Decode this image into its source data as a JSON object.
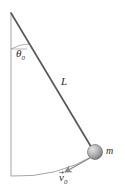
{
  "figure": {
    "kind": "pendulum-diagram",
    "background_color": "#ffffff",
    "line_color": "#4a4a4a",
    "thin_line_color": "#9a9a9a",
    "text_color": "#2b2b2b",
    "bob_color_light": "#d8d8d8",
    "bob_color_mid": "#a9a9a9",
    "bob_color_dark": "#7d7d7d"
  },
  "labels": {
    "angle": {
      "symbol": "θ",
      "subscript": "0",
      "text": "θ0"
    },
    "length": {
      "symbol": "L",
      "text": "L"
    },
    "mass": {
      "symbol": "m",
      "text": "m"
    },
    "velocity": {
      "symbol": "v",
      "subscript": "0",
      "text": "v0"
    }
  },
  "geometry": {
    "pivot": {
      "x": 11,
      "y": 13
    },
    "bob_center": {
      "x": 95,
      "y": 152
    },
    "bob_radius": 7.5,
    "vertical_line_end": {
      "y": 176
    },
    "angle_arc_radius": 36,
    "velocity_arrow_start": {
      "x": 89,
      "y": 159
    },
    "velocity_arrow_end": {
      "x": 64,
      "y": 173
    }
  }
}
